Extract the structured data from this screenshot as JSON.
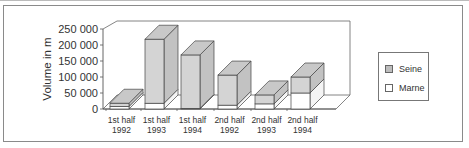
{
  "chart_data": {
    "type": "bar",
    "subtype": "3d-stacked",
    "title": "",
    "xlabel": "",
    "ylabel": "Volume in m",
    "ylim": [
      0,
      250000
    ],
    "yticks": [
      "0",
      "50 000",
      "100 000",
      "150 000",
      "200 000",
      "250 000"
    ],
    "categories": [
      [
        "1st half",
        "1992"
      ],
      [
        "1st half",
        "1993"
      ],
      [
        "1st half",
        "1994"
      ],
      [
        "2nd half",
        "1992"
      ],
      [
        "2nd half",
        "1993"
      ],
      [
        "2nd half",
        "1994"
      ]
    ],
    "series": [
      {
        "name": "Marne",
        "color": "#ffffff",
        "values": [
          8000,
          18000,
          2000,
          12000,
          16000,
          50000
        ]
      },
      {
        "name": "Seine",
        "color": "#c8c8c8",
        "values": [
          10000,
          200000,
          167000,
          94000,
          28000,
          50000
        ]
      }
    ],
    "legend": {
      "position": "right",
      "entries": [
        "Seine",
        "Marne"
      ]
    },
    "grid": false
  },
  "legend": {
    "items": [
      {
        "label": "Seine",
        "color": "#bdbdbd"
      },
      {
        "label": "Marne",
        "color": "#ffffff"
      }
    ]
  },
  "axis": {
    "ylabel": "Volume in m",
    "ticks": [
      "0",
      "50 000",
      "100 000",
      "150 000",
      "200 000",
      "250 000"
    ],
    "categories": [
      {
        "line1": "1st half",
        "line2": "1992"
      },
      {
        "line1": "1st half",
        "line2": "1993"
      },
      {
        "line1": "1st half",
        "line2": "1994"
      },
      {
        "line1": "2nd half",
        "line2": "1992"
      },
      {
        "line1": "2nd half",
        "line2": "1993"
      },
      {
        "line1": "2nd half",
        "line2": "1994"
      }
    ]
  }
}
